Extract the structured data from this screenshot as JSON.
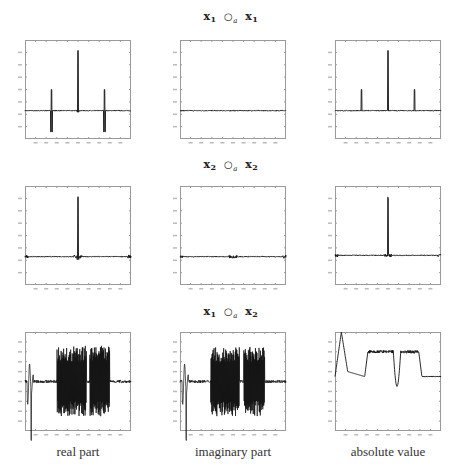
{
  "rows": [
    {
      "title_a": "x",
      "sub_a": "1",
      "op": "○",
      "op_sub": "a",
      "title_b": "x",
      "sub_b": "1"
    },
    {
      "title_a": "x",
      "sub_a": "2",
      "op": "○",
      "op_sub": "a",
      "title_b": "x",
      "sub_b": "2"
    },
    {
      "title_a": "x",
      "sub_a": "1",
      "op": "○",
      "op_sub": "a",
      "title_b": "x",
      "sub_b": "2"
    }
  ],
  "columns": [
    {
      "label": "real part"
    },
    {
      "label": "imaginary part"
    },
    {
      "label": "absolute value"
    }
  ],
  "chart_data": [
    {
      "type": "line",
      "title": "x1 ∘a x1 — real part",
      "row": 0,
      "col": 0,
      "xlim": [
        0,
        1
      ],
      "ylim": [
        -0.4,
        1.0
      ],
      "xticks": 10,
      "yticks": 8,
      "description": "flat near 0, central positive spike ~0.85 at x≈0.5, bipolar spikes ±0.3 at x≈0.25 and x≈0.75",
      "features": [
        {
          "x": 0.25,
          "pos": 0.3,
          "neg": -0.3
        },
        {
          "x": 0.5,
          "pos": 0.85,
          "neg": -0.02
        },
        {
          "x": 0.75,
          "pos": 0.3,
          "neg": -0.3
        }
      ],
      "baseline": 0
    },
    {
      "type": "line",
      "title": "x1 ∘a x1 — imaginary part",
      "row": 0,
      "col": 1,
      "xlim": [
        0,
        1
      ],
      "ylim": [
        -0.4,
        1.0
      ],
      "xticks": 10,
      "yticks": 8,
      "description": "flat line at 0",
      "features": [],
      "baseline": 0
    },
    {
      "type": "line",
      "title": "x1 ∘a x1 — absolute value",
      "row": 0,
      "col": 2,
      "xlim": [
        0,
        1
      ],
      "ylim": [
        -0.4,
        1.0
      ],
      "xticks": 10,
      "yticks": 8,
      "description": "flat near 0, central spike ~0.85 at x≈0.5, side spikes ~0.3 at x≈0.25 and x≈0.75",
      "features": [
        {
          "x": 0.25,
          "pos": 0.3,
          "neg": 0
        },
        {
          "x": 0.5,
          "pos": 0.85,
          "neg": 0
        },
        {
          "x": 0.75,
          "pos": 0.3,
          "neg": 0
        }
      ],
      "baseline": 0
    },
    {
      "type": "line",
      "title": "x2 ∘a x2 — real part",
      "row": 1,
      "col": 0,
      "xlim": [
        0,
        1
      ],
      "ylim": [
        -0.4,
        1.0
      ],
      "xticks": 10,
      "yticks": 8,
      "description": "flat near 0 with small wiggles at edges and center, single spike ~0.85 at x≈0.5",
      "features": [
        {
          "x": 0.5,
          "pos": 0.85,
          "neg": -0.03
        }
      ],
      "baseline": 0
    },
    {
      "type": "line",
      "title": "x2 ∘a x2 — imaginary part",
      "row": 1,
      "col": 1,
      "xlim": [
        0,
        1
      ],
      "ylim": [
        -0.4,
        1.0
      ],
      "xticks": 10,
      "yticks": 8,
      "description": "flat near 0 with small wiggles at edges and center",
      "features": [],
      "baseline": 0
    },
    {
      "type": "line",
      "title": "x2 ∘a x2 — absolute value",
      "row": 1,
      "col": 2,
      "xlim": [
        0,
        1
      ],
      "ylim": [
        -0.4,
        1.0
      ],
      "xticks": 10,
      "yticks": 8,
      "description": "near 0 slightly raised at edges, single spike ~0.85 at x≈0.5",
      "features": [
        {
          "x": 0.5,
          "pos": 0.85,
          "neg": 0
        }
      ],
      "baseline": 0.02
    },
    {
      "type": "line",
      "title": "x1 ∘a x2 — real part",
      "row": 2,
      "col": 0,
      "xlim": [
        0,
        1
      ],
      "ylim": [
        -1,
        1
      ],
      "xticks": 10,
      "yticks": 10,
      "description": "early oscillation near x≈0.05, dense high-amplitude oscillation bursts over x≈0.3-0.58 and x≈0.6-0.8, low noise elsewhere",
      "bursts": [
        [
          0.3,
          0.58,
          0.72
        ],
        [
          0.61,
          0.8,
          0.72
        ]
      ],
      "early": [
        0.02,
        0.08
      ],
      "baseline": 0
    },
    {
      "type": "line",
      "title": "x1 ∘a x2 — imaginary part",
      "row": 2,
      "col": 1,
      "xlim": [
        0,
        1
      ],
      "ylim": [
        -1,
        1
      ],
      "xticks": 10,
      "yticks": 10,
      "description": "similar to real part with bursts over x≈0.28-0.56 and x≈0.6-0.8",
      "bursts": [
        [
          0.29,
          0.56,
          0.7
        ],
        [
          0.6,
          0.8,
          0.7
        ]
      ],
      "early": [
        0.02,
        0.08
      ],
      "baseline": 0
    },
    {
      "type": "line",
      "title": "x1 ∘a x2 — absolute value",
      "row": 2,
      "col": 2,
      "xlim": [
        0,
        1
      ],
      "ylim": [
        -1,
        1
      ],
      "xticks": 10,
      "yticks": 10,
      "description": "peak at x≈0.06 near top, dips to ~0.1, plateaus ~0.6 over x≈0.31-0.55 and x≈0.62-0.79, dip near x≈0.57, low ~0.1 after 0.82",
      "plateaus": [
        [
          0.31,
          0.55,
          0.6
        ],
        [
          0.62,
          0.79,
          0.6
        ]
      ],
      "baseline": 0.1
    }
  ],
  "colors": {
    "axes": "#9a9a9a",
    "line": "#111111",
    "background": "#ffffff"
  }
}
